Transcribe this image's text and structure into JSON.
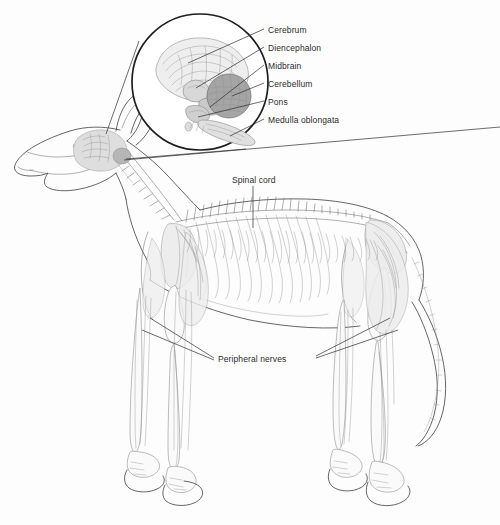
{
  "figure": {
    "background_color": "#fdfdfd",
    "ink_color": "#3a3a3a",
    "text_color": "#2b2b2b",
    "view": "lateral whole-body with magnified brain inset"
  },
  "inset": {
    "name": "brain-magnification-circle",
    "shape": "circle",
    "center_x": 200,
    "center_y": 82,
    "radius": 68,
    "structures": [
      {
        "name": "cerebrum",
        "shading": "#e3e3e3"
      },
      {
        "name": "diencephalon",
        "shading": "#cfcfcf"
      },
      {
        "name": "midbrain",
        "shading": "#c4c4c4"
      },
      {
        "name": "cerebellum",
        "shading": "#9a9a9a"
      },
      {
        "name": "pons",
        "shading": "#c9c9c9"
      },
      {
        "name": "medulla-oblongata",
        "shading": "#dadada"
      }
    ]
  },
  "labels": {
    "brain_parts": [
      {
        "id": "cerebrum",
        "text": "Cerebrum",
        "x": 268,
        "y": 31
      },
      {
        "id": "diencephalon",
        "text": "Diencephalon",
        "x": 268,
        "y": 49
      },
      {
        "id": "midbrain",
        "text": "Midbrain",
        "x": 268,
        "y": 67
      },
      {
        "id": "cerebellum",
        "text": "Cerebellum",
        "x": 268,
        "y": 85
      },
      {
        "id": "pons",
        "text": "Pons",
        "x": 268,
        "y": 103
      },
      {
        "id": "medulla_oblongata",
        "text": "Medulla oblongata",
        "x": 268,
        "y": 121
      }
    ],
    "body_parts": [
      {
        "id": "spinal_cord",
        "text": "Spinal cord",
        "x": 232,
        "y": 181
      },
      {
        "id": "peripheral_nerves",
        "text": "Peripheral nerves",
        "x": 218,
        "y": 355
      }
    ]
  }
}
